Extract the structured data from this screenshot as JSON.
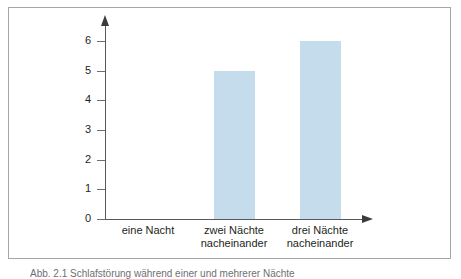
{
  "figure": {
    "caption_partial": "Abb. 2.1   Schlafstörung während einer und mehrerer Nächte"
  },
  "chart_data": {
    "type": "bar",
    "title": "",
    "subtitle": "",
    "xlabel": "",
    "ylabel": "",
    "categories": [
      "eine Nacht",
      "zwei Nächte nacheinander",
      "drei Nächte nacheinander"
    ],
    "category_lines": [
      [
        "eine Nacht",
        ""
      ],
      [
        "zwei Nächte",
        "nacheinander"
      ],
      [
        "drei Nächte",
        "nacheinander"
      ]
    ],
    "values": [
      0,
      5,
      6
    ],
    "ylim": [
      0,
      6
    ],
    "yticks": [
      0,
      1,
      2,
      3,
      4,
      5,
      6
    ],
    "ytick_labels": [
      "0",
      "1",
      "2",
      "3",
      "4",
      "5",
      "6"
    ],
    "grid": false,
    "legend": false,
    "legend_position": "none",
    "bar_color": "#c5dced",
    "axis_color": "#58595b",
    "text_color": "#231f20",
    "frame_color": "#a6a6a6",
    "background": "#ffffff"
  }
}
